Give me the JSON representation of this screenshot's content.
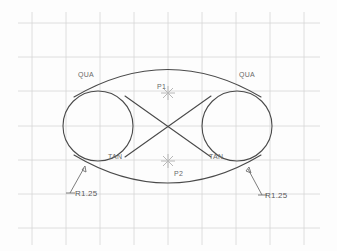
{
  "drawing": {
    "title": "CAD Geometry Construction",
    "background_color": "#fdfdfd",
    "grid_color": "#d6d6d6",
    "geometry_color": "#4a4a4a",
    "marker_color": "#b8b8b8",
    "label_color": "#6a6a6a"
  },
  "grid": {
    "spacing_px": 34,
    "origin_x": 32,
    "origin_y": 23,
    "columns": 9,
    "rows": 7,
    "visible": true
  },
  "snap_labels": [
    {
      "id": "qua-left",
      "text": "QUA",
      "x": 78,
      "y": 74
    },
    {
      "id": "qua-right",
      "text": "QUA",
      "x": 239,
      "y": 74
    },
    {
      "id": "tan-left",
      "text": "TAN",
      "x": 108,
      "y": 156
    },
    {
      "id": "tan-right",
      "text": "TAN",
      "x": 209,
      "y": 156
    }
  ],
  "point_labels": [
    {
      "id": "p1",
      "text": "P1",
      "x": 159,
      "y": 86,
      "marker_x": 168,
      "marker_y": 93
    },
    {
      "id": "p2",
      "text": "P2",
      "x": 172,
      "y": 173,
      "marker_x": 168,
      "marker_y": 161
    }
  ],
  "dimensions": [
    {
      "id": "radius-left",
      "text": "R1.25",
      "x": 72,
      "y": 195
    },
    {
      "id": "radius-right",
      "text": "R1.25",
      "x": 263,
      "y": 197
    }
  ],
  "circles": [
    {
      "id": "circle-left",
      "cx": 98,
      "cy": 126,
      "r": 35
    },
    {
      "id": "circle-right",
      "cx": 237,
      "cy": 126,
      "r": 35
    }
  ],
  "arcs": {
    "top": "M 74 97 Q 168 42 261 97",
    "bottom": "M 74 155 Q 168 211 261 155"
  },
  "tangent_lines": [
    {
      "id": "tangent-line-a",
      "x1": 125,
      "y1": 96,
      "x2": 211,
      "y2": 157
    },
    {
      "id": "tangent-line-b",
      "x1": 125,
      "y1": 157,
      "x2": 211,
      "y2": 96
    }
  ],
  "leaders": [
    {
      "id": "leader-left",
      "path": "M 70 193 L 84 168",
      "tick": "M 66 193 L 74 193"
    },
    {
      "id": "leader-right",
      "path": "M 261 195 L 248 169",
      "tick": "M 257 195 L 265 195"
    }
  ]
}
